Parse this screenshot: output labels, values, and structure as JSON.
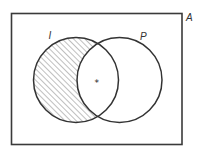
{
  "diagram": {
    "type": "venn",
    "universe": {
      "label": "A"
    },
    "sets": [
      {
        "id": "I",
        "label": "I",
        "shaded_region": "I minus P"
      },
      {
        "id": "P",
        "label": "P"
      }
    ],
    "marker": {
      "symbol": "*",
      "region": "I intersect P"
    },
    "colors": {
      "stroke": "#3a3a3a",
      "hatch": "#7a7a7a",
      "background": "#ffffff"
    }
  }
}
